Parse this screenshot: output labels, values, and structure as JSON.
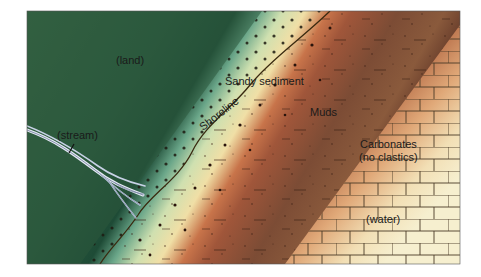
{
  "figure": {
    "type": "geologic-block-diagram"
  },
  "labels": {
    "land": "(land)",
    "stream": "(stream)",
    "sandy_sediment": "Sandy sediment",
    "shoreline": "Shoreline",
    "muds": "Muds",
    "carbonates": "Carbonates",
    "carbonates_note": "(no clastics)",
    "water": "(water)"
  },
  "zones": [
    {
      "name": "land",
      "color": "#2f5a3a"
    },
    {
      "name": "sandy-sediment",
      "color": "#e9e0a8"
    },
    {
      "name": "muds",
      "color": "#8a5236"
    },
    {
      "name": "carbonates",
      "color": "#f3ecc6"
    }
  ],
  "colors": {
    "land_dark": "#1f4a34",
    "land_light": "#3d6a46",
    "sand_green": "#7fb79a",
    "sand_pale": "#efe3ad",
    "mud_red": "#a0563a",
    "mud_brown": "#7a4b33",
    "carbonate_warm": "#d7935f",
    "carbonate_cream": "#f6efcf",
    "shoreline": "#3a2a10",
    "stream": "#c8d2e6",
    "brick_line": "#4a3a25"
  }
}
